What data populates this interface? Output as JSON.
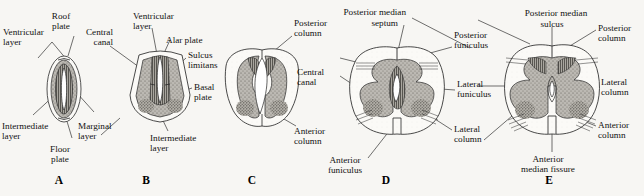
{
  "figure": {
    "background_color": "#f7f6f3",
    "ink_color": "#111111",
    "gray_matter_color": "#b9b6b0",
    "white_matter_color": "#fbfaf7"
  },
  "panels": [
    {
      "letter": "A",
      "labels": [
        {
          "id": "roof-plate",
          "text_lines": [
            "Roof",
            "plate"
          ]
        },
        {
          "id": "ventricular-layer",
          "text_lines": [
            "Ventricular",
            "layer"
          ]
        },
        {
          "id": "intermediate-layer",
          "text_lines": [
            "Intermediate",
            "layer"
          ]
        },
        {
          "id": "marginal-layer",
          "text_lines": [
            "Marginal",
            "layer"
          ]
        },
        {
          "id": "floor-plate",
          "text_lines": [
            "Floor",
            "plate"
          ]
        }
      ]
    },
    {
      "letter": "B",
      "labels": [
        {
          "id": "central-canal",
          "text_lines": [
            "Central",
            "canal"
          ]
        },
        {
          "id": "ventricular-layer",
          "text_lines": [
            "Ventricular",
            "layer"
          ]
        },
        {
          "id": "alar-plate",
          "text_lines": [
            "Alar plate"
          ]
        },
        {
          "id": "sulcus-limitans",
          "text_lines": [
            "Sulcus",
            "limitans"
          ]
        },
        {
          "id": "basal-plate",
          "text_lines": [
            "Basal",
            "plate"
          ]
        },
        {
          "id": "intermediate-layer",
          "text_lines": [
            "Intermediate",
            "layer"
          ]
        }
      ]
    },
    {
      "letter": "C",
      "labels": [
        {
          "id": "posterior-column",
          "text_lines": [
            "Posterior",
            "column"
          ]
        },
        {
          "id": "central-canal",
          "text_lines": [
            "Central",
            "canal"
          ]
        },
        {
          "id": "anterior-column",
          "text_lines": [
            "Anterior",
            "column"
          ]
        }
      ]
    },
    {
      "letter": "D",
      "labels": [
        {
          "id": "posterior-median-septum",
          "text_lines": [
            "Posterior median",
            "septum"
          ]
        },
        {
          "id": "posterior-funiculus",
          "text_lines": [
            "Posterior",
            "funiculus"
          ]
        },
        {
          "id": "lateral-funiculus",
          "text_lines": [
            "Lateral",
            "funiculus"
          ]
        },
        {
          "id": "lateral-column",
          "text_lines": [
            "Lateral",
            "column"
          ]
        },
        {
          "id": "anterior-funiculus",
          "text_lines": [
            "Anterior",
            "funiculus"
          ]
        }
      ]
    },
    {
      "letter": "E",
      "labels": [
        {
          "id": "posterior-median-sulcus",
          "text_lines": [
            "Posterior median",
            "sulcus"
          ]
        },
        {
          "id": "posterior-column",
          "text_lines": [
            "Posterior",
            "column"
          ]
        },
        {
          "id": "lateral-column",
          "text_lines": [
            "Lateral",
            "column"
          ]
        },
        {
          "id": "anterior-column",
          "text_lines": [
            "Anterior",
            "column"
          ]
        },
        {
          "id": "anterior-median-fissure",
          "text_lines": [
            "Anterior",
            "median fissure"
          ]
        }
      ]
    }
  ],
  "text": {
    "a": {
      "letter": "A",
      "roof_plate_1": "Roof",
      "roof_plate_2": "plate",
      "ventricular_1": "Ventricular",
      "ventricular_2": "layer",
      "intermediate_1": "Intermediate",
      "intermediate_2": "layer",
      "marginal_1": "Marginal",
      "marginal_2": "layer",
      "floor_1": "Floor",
      "floor_2": "plate"
    },
    "b": {
      "letter": "B",
      "central_canal_1": "Central",
      "central_canal_2": "canal",
      "ventricular_1": "Ventricular",
      "ventricular_2": "layer",
      "alar_plate": "Alar plate",
      "sulcus_1": "Sulcus",
      "sulcus_2": "limitans",
      "basal_1": "Basal",
      "basal_2": "plate",
      "intermediate_1": "Intermediate",
      "intermediate_2": "layer"
    },
    "c": {
      "letter": "C",
      "posterior_col_1": "Posterior",
      "posterior_col_2": "column",
      "central_canal_1": "Central",
      "central_canal_2": "canal",
      "anterior_col_1": "Anterior",
      "anterior_col_2": "column"
    },
    "d": {
      "letter": "D",
      "pms_1": "Posterior median",
      "pms_2": "septum",
      "post_fun_1": "Posterior",
      "post_fun_2": "funiculus",
      "lat_fun_1": "Lateral",
      "lat_fun_2": "funiculus",
      "lat_col_1": "Lateral",
      "lat_col_2": "column",
      "ant_fun_1": "Anterior",
      "ant_fun_2": "funiculus"
    },
    "e": {
      "letter": "E",
      "pms_1": "Posterior median",
      "pms_2": "sulcus",
      "post_col_1": "Posterior",
      "post_col_2": "column",
      "lat_col_1": "Lateral",
      "lat_col_2": "column",
      "ant_col_1": "Anterior",
      "ant_col_2": "column",
      "amf_1": "Anterior",
      "amf_2": "median fissure"
    }
  }
}
